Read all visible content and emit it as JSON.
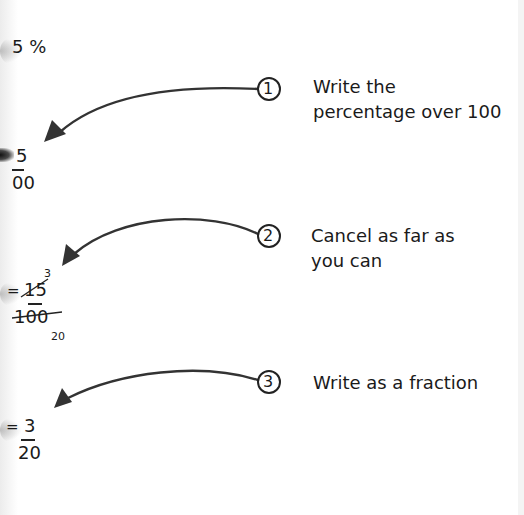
{
  "diagram": {
    "start_value": "5 %",
    "steps": [
      {
        "number": "1",
        "instruction_lines": [
          "Write the",
          "percentage over 100"
        ],
        "result": {
          "equals": "",
          "numerator": "5",
          "denominator": "00"
        }
      },
      {
        "number": "2",
        "instruction_lines": [
          "Cancel as far as",
          "you can"
        ],
        "result": {
          "equals": "=",
          "numerator": "15",
          "denominator": "100",
          "cancelled_numerator": "3",
          "cancelled_denominator": "20"
        }
      },
      {
        "number": "3",
        "instruction_lines": [
          "Write as a fraction"
        ],
        "result": {
          "equals": "=",
          "numerator": "3",
          "denominator": "20"
        }
      }
    ],
    "colors": {
      "ink": "#1a1a1a",
      "arrow": "#333333",
      "background": "#ffffff"
    }
  }
}
